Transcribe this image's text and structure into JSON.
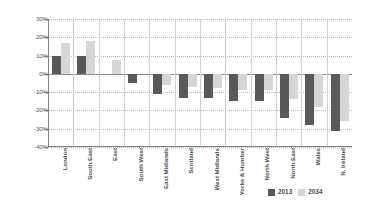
{
  "chart_data": {
    "type": "bar",
    "title": "",
    "subtitle": "",
    "xlabel": "",
    "ylabel": "",
    "ylim": [
      -40,
      30
    ],
    "ytick_labels": [
      "30%",
      "20%",
      "10%",
      "0%",
      "-10%",
      "-20%",
      "-30%",
      "-40%"
    ],
    "ytick_values": [
      30,
      20,
      10,
      0,
      -10,
      -20,
      -30,
      -40
    ],
    "grid": true,
    "legend_position": "bottom-right",
    "categories": [
      "London",
      "South East",
      "East",
      "South West",
      "East Midlands",
      "Scotland",
      "West Midlands",
      "Yorks & Humber",
      "North West",
      "North East",
      "Wales",
      "N. Ireland"
    ],
    "series": [
      {
        "name": "2013",
        "color": "#595959",
        "values": [
          10,
          10,
          0,
          -5,
          -11,
          -13,
          -13,
          -15,
          -15,
          -24,
          -28,
          -31
        ]
      },
      {
        "name": "2034",
        "color": "#d6d6d6",
        "values": [
          17,
          18,
          7.5,
          0,
          -6,
          -7,
          -8,
          -9,
          -9,
          -14,
          -18,
          -26
        ]
      }
    ]
  },
  "legend": {
    "items": [
      {
        "label": "2013"
      },
      {
        "label": "2034"
      }
    ]
  },
  "colors": {
    "series_2013": "#595959",
    "series_2034": "#d6d6d6",
    "axis": "#808080",
    "gridline": "#b9b9b9",
    "text": "#4d4d4d",
    "background": "#ffffff"
  }
}
